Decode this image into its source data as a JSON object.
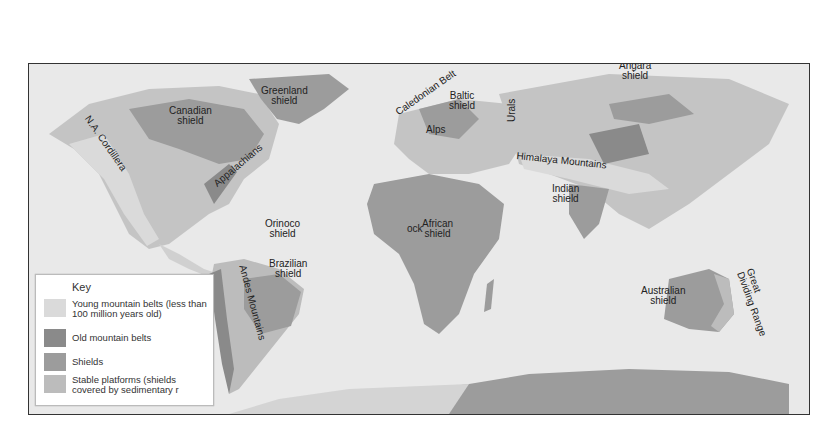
{
  "map": {
    "colors": {
      "ocean": "#e9e9e9",
      "young_mountain": "#dadada",
      "old_mountain": "#8a8a8a",
      "shield": "#9c9c9c",
      "stable_platform": "#bcbcbc",
      "border": "#333333"
    },
    "labels": {
      "greenland": "Greenland\nshield",
      "canadian": "Canadian\nshield",
      "na_cordillera": "N.A. Cordillera",
      "appalachians": "Appalachians",
      "caledonian": "Caledonian Belt",
      "baltic": "Baltic\nshield",
      "urals": "Urals",
      "alps": "Alps",
      "angara": "Angara\nshield",
      "himalaya": "Himalaya Mountains",
      "indian": "Indian\nshield",
      "orinoco": "Orinoco\nshield",
      "brazilian": "Brazilian\nshield",
      "andes": "Andes Mountains",
      "african": "African\nshield",
      "african_fragment": "ock",
      "australian": "Australian\nshield",
      "great_dividing": "Great\nDividing Range"
    }
  },
  "key": {
    "title": "Key",
    "items": [
      {
        "label": "Young mountain belts (less than 100 million years old)",
        "color": "#dadada"
      },
      {
        "label": "Old mountain belts",
        "color": "#8a8a8a"
      },
      {
        "label": "Shields",
        "color": "#9c9c9c"
      },
      {
        "label": "Stable platforms (shields covered by sedimentary r",
        "color": "#bcbcbc"
      }
    ]
  }
}
